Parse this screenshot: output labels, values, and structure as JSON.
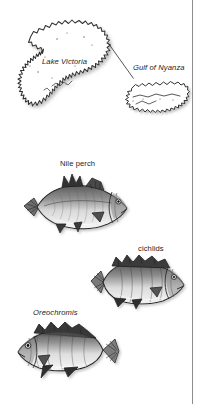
{
  "figure": {
    "background_color": "#ffffff",
    "ink_color": "#1b1b1b",
    "rule_color": "#8d8d8d",
    "width": 205,
    "height": 404
  },
  "map": {
    "lake_label": "Lake Victoria",
    "inset_label": "Gulf of Nyanza",
    "leader_line": "leader-line-lake-to-inset"
  },
  "fishes": [
    {
      "label": "Nile perch",
      "italic": false,
      "icon": "nile-perch-illustration",
      "facing": "right"
    },
    {
      "label": "cichlids",
      "italic": false,
      "icon": "cichlid-illustration",
      "facing": "right"
    },
    {
      "label": "Oreochromis",
      "italic": true,
      "icon": "oreochromis-illustration",
      "facing": "left"
    }
  ]
}
